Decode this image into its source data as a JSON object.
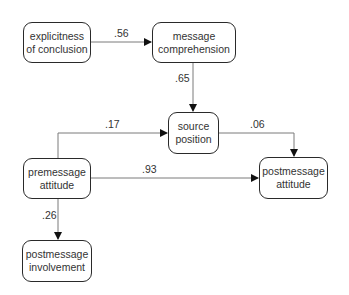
{
  "diagram": {
    "type": "path-diagram",
    "nodes": {
      "explicitness": {
        "line1": "explicitness",
        "line2": "of conclusion"
      },
      "comprehension": {
        "line1": "message",
        "line2": "comprehension"
      },
      "source": {
        "line1": "source",
        "line2": "position"
      },
      "post_attitude": {
        "line1": "postmessage",
        "line2": "attitude"
      },
      "pre_attitude": {
        "line1": "premessage",
        "line2": "attitude"
      },
      "post_involvement": {
        "line1": "postmessage",
        "line2": "involvement"
      }
    },
    "edges": [
      {
        "from": "explicitness of conclusion",
        "to": "message comprehension",
        "coef": ".56"
      },
      {
        "from": "message comprehension",
        "to": "source position",
        "coef": ".65"
      },
      {
        "from": "premessage attitude",
        "to": "source position",
        "coef": ".17"
      },
      {
        "from": "source position",
        "to": "postmessage attitude",
        "coef": ".06"
      },
      {
        "from": "premessage attitude",
        "to": "postmessage attitude",
        "coef": ".93"
      },
      {
        "from": "premessage attitude",
        "to": "postmessage involvement",
        "coef": ".26"
      }
    ],
    "colors": {
      "line": "#7a7a7a",
      "border": "#2a2a2a",
      "text": "#333333"
    }
  }
}
